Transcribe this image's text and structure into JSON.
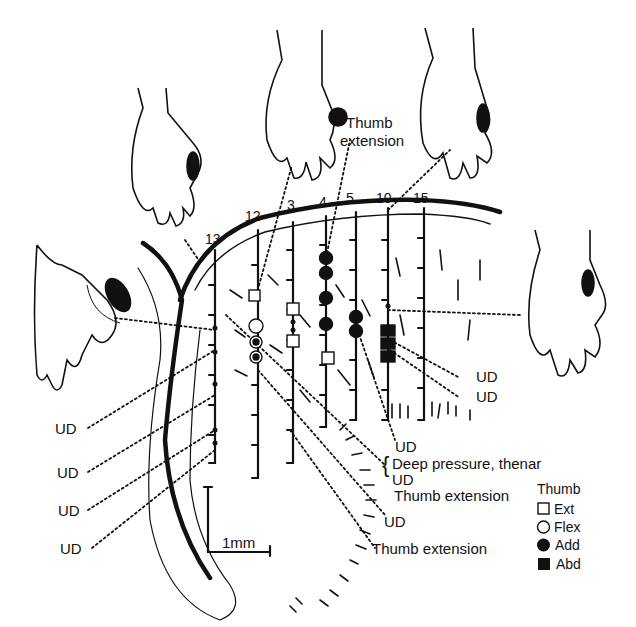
{
  "figure": {
    "track_labels": [
      "13",
      "12",
      "3",
      "4",
      "5",
      "10",
      "15"
    ],
    "hand_annotation": "Thumb\nextension",
    "hand_annotation_line1": "Thumb",
    "hand_annotation_line2": "extension",
    "left_labels": [
      "UD",
      "UD",
      "UD",
      "UD"
    ],
    "right_labels": [
      "UD",
      "UD"
    ],
    "bottom_labels": {
      "ud_top": "UD",
      "brace_items": [
        "Deep pressure, thenar",
        "UD",
        "Thumb extension"
      ],
      "ud_lower": "UD",
      "thumb_ext_lower": "Thumb extension"
    },
    "scale_bar": "1mm",
    "legend": {
      "title": "Thumb",
      "items": [
        {
          "symbol": "open-square",
          "label": "Ext"
        },
        {
          "symbol": "open-circle",
          "label": "Flex"
        },
        {
          "symbol": "filled-circle",
          "label": "Add"
        },
        {
          "symbol": "filled-square",
          "label": "Abd"
        }
      ]
    },
    "colors": {
      "ink": "#111111",
      "background": "#ffffff"
    }
  }
}
